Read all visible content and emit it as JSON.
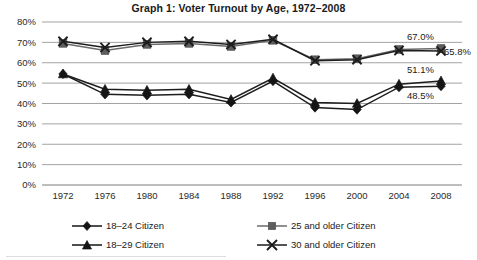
{
  "chart_data": {
    "type": "line",
    "title": "Graph 1: Voter Turnout by Age, 1972–2008",
    "xlabel": "",
    "ylabel": "",
    "categories": [
      "1972",
      "1976",
      "1980",
      "1984",
      "1988",
      "1992",
      "1996",
      "2000",
      "2004",
      "2008"
    ],
    "ylim": [
      0,
      80
    ],
    "y_tick_labels": [
      "0%",
      "10%",
      "20%",
      "30%",
      "40%",
      "50%",
      "60%",
      "70%",
      "80%"
    ],
    "y_ticks": [
      0,
      10,
      20,
      30,
      40,
      50,
      60,
      70,
      80
    ],
    "grid": true,
    "legend_position": "bottom",
    "series": [
      {
        "name": "18–24 Citizen",
        "marker": "diamond",
        "color": "#151515",
        "values": [
          54.5,
          44.5,
          44.0,
          44.5,
          40.5,
          51.0,
          38.0,
          37.0,
          48.0,
          48.5
        ],
        "end_label": "48.5%"
      },
      {
        "name": "25 and older Citizen",
        "marker": "square",
        "color": "#5e5e5e",
        "values": [
          69.5,
          66.0,
          69.0,
          69.5,
          68.0,
          71.0,
          61.5,
          62.0,
          66.5,
          67.0
        ],
        "end_label": "67.0%"
      },
      {
        "name": "18–29 Citizen",
        "marker": "triangle",
        "color": "#151515",
        "values": [
          54.5,
          47.0,
          46.5,
          47.0,
          42.0,
          52.5,
          40.5,
          40.0,
          49.5,
          51.1
        ],
        "end_label": "51.1%"
      },
      {
        "name": "30 and older Citizen",
        "marker": "x",
        "color": "#1d1d1d",
        "values": [
          70.5,
          67.5,
          70.0,
          70.5,
          69.0,
          71.5,
          61.0,
          61.5,
          66.0,
          65.8
        ],
        "end_label": "65.8%"
      }
    ],
    "annotations": [
      {
        "text": "67.0%",
        "series": "25 and older Citizen",
        "at": "2008"
      },
      {
        "text": "65.8%",
        "series": "30 and older Citizen",
        "at": "2008"
      },
      {
        "text": "51.1%",
        "series": "18–29 Citizen",
        "at": "2008"
      },
      {
        "text": "48.5%",
        "series": "18–24 Citizen",
        "at": "2008"
      }
    ]
  },
  "legend": {
    "items": [
      {
        "label": "18–24 Citizen",
        "marker": "diamond"
      },
      {
        "label": "25 and older Citizen",
        "marker": "square"
      },
      {
        "label": "18–29 Citizen",
        "marker": "triangle"
      },
      {
        "label": "30 and older Citizen",
        "marker": "x"
      }
    ]
  },
  "colors": {
    "dark_series": "#151515",
    "gray_series": "#5e5e5e",
    "gridline": "#8c8c8c",
    "text": "#1a1a1a",
    "background": "#ffffff"
  }
}
